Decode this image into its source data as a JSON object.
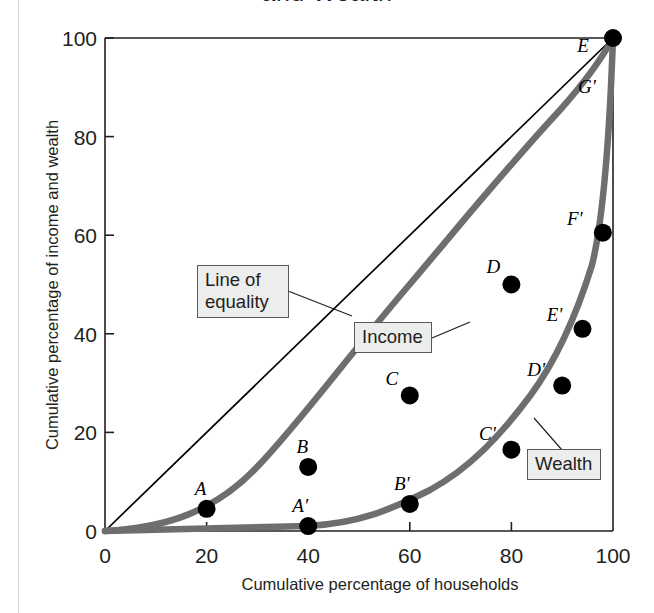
{
  "figure": {
    "title": "and Wealth",
    "title_note": "top of title cropped above image edge"
  },
  "chart_data": {
    "type": "line",
    "title": "and Wealth",
    "xlabel": "Cumulative percentage of households",
    "ylabel": "Cumulative percentage of income and wealth",
    "xlim": [
      0,
      100
    ],
    "ylim": [
      0,
      100
    ],
    "xticks": [
      "0",
      "20",
      "40",
      "60",
      "80",
      "100"
    ],
    "yticks": [
      "0",
      "20",
      "40",
      "60",
      "80",
      "100"
    ],
    "xtick_values": [
      0,
      20,
      40,
      60,
      80,
      100
    ],
    "ytick_values": [
      0,
      20,
      40,
      60,
      80,
      100
    ],
    "grid": false,
    "legend": "inline boxed callouts",
    "series": [
      {
        "name": "Line of equality",
        "style": "thin black straight line",
        "color": "#000000",
        "x": [
          0,
          100
        ],
        "values": [
          0,
          100
        ]
      },
      {
        "name": "Income",
        "style": "thick gray curve",
        "color": "#6e6e70",
        "x": [
          0,
          20,
          40,
          60,
          80,
          95,
          100
        ],
        "values": [
          0,
          4.5,
          13,
          27.5,
          50,
          61.5,
          100
        ]
      },
      {
        "name": "Wealth",
        "style": "thick gray curve",
        "color": "#6e6e70",
        "x": [
          0,
          20,
          40,
          60,
          80,
          90,
          94,
          100
        ],
        "values": [
          0,
          0.2,
          1,
          5.5,
          16.5,
          29.5,
          41,
          100
        ]
      }
    ],
    "points": [
      {
        "label": "A",
        "x": 20,
        "y": 4.5,
        "series": "Income",
        "label_dx": -6,
        "label_dy": -14
      },
      {
        "label": "B",
        "x": 40,
        "y": 13,
        "series": "Income",
        "label_dx": -6,
        "label_dy": -14
      },
      {
        "label": "C",
        "x": 60,
        "y": 27.5,
        "series": "Income",
        "label_dx": -18,
        "label_dy": -10
      },
      {
        "label": "D",
        "x": 80,
        "y": 50,
        "series": "Income",
        "label_dx": -18,
        "label_dy": -12
      },
      {
        "label": "E",
        "x": 100,
        "y": 100,
        "series": "Income",
        "label_dx": -30,
        "label_dy": 14
      },
      {
        "label": "A'",
        "x": 40,
        "y": 1,
        "series": "Wealth",
        "label_dx": -8,
        "label_dy": -14
      },
      {
        "label": "B'",
        "x": 60,
        "y": 5.5,
        "series": "Wealth",
        "label_dx": -8,
        "label_dy": -14
      },
      {
        "label": "C'",
        "x": 80,
        "y": 16.5,
        "series": "Wealth",
        "label_dx": -24,
        "label_dy": -10
      },
      {
        "label": "D'",
        "x": 90,
        "y": 29.5,
        "series": "Wealth",
        "label_dx": -26,
        "label_dy": -10
      },
      {
        "label": "E'",
        "x": 94,
        "y": 41,
        "series": "Wealth",
        "label_dx": -28,
        "label_dy": -8
      },
      {
        "label": "F'",
        "x": 98,
        "y": 60.5,
        "series": "Wealth",
        "label_dx": -28,
        "label_dy": -8
      }
    ],
    "curve_labels": [
      {
        "label": "G'",
        "x": 98,
        "y": 89,
        "note": "label on income curve near top"
      }
    ],
    "annotations": [
      {
        "label": "Line of equality",
        "lines": [
          "Line of",
          "equality"
        ]
      },
      {
        "label": "Income",
        "lines": [
          "Income"
        ]
      },
      {
        "label": "Wealth",
        "lines": [
          "Wealth"
        ]
      }
    ]
  },
  "colors": {
    "curve_gray": "#6e6e70",
    "axis_black": "#231f20",
    "callout_fill": "#eceded",
    "callout_border": "#58585b",
    "page_edge": "#d9d9d9"
  }
}
